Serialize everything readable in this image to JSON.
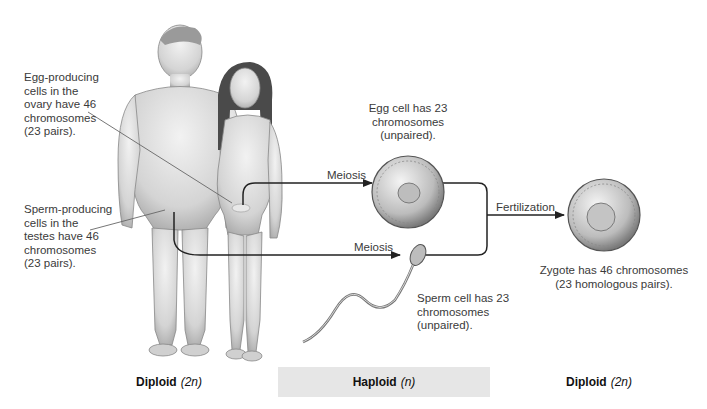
{
  "figure": {
    "callouts": {
      "egg_producing": [
        "Egg-producing",
        "cells in the",
        "ovary have 46",
        "chromosomes",
        "(23 pairs)."
      ],
      "sperm_producing": [
        "Sperm-producing",
        "cells in the",
        "testes have 46",
        "chromosomes",
        "(23 pairs)."
      ],
      "egg_cell": [
        "Egg cell has 23",
        "chromosomes",
        "(unpaired)."
      ],
      "sperm_cell": [
        "Sperm cell has 23",
        "chromosomes",
        "(unpaired)."
      ],
      "zygote": [
        "Zygote has 46 chromosomes",
        "(23 homologous pairs)."
      ]
    },
    "arrows": {
      "meiosis_top": "Meiosis",
      "meiosis_bottom": "Meiosis",
      "fertilization": "Fertilization"
    },
    "bands": [
      {
        "label": "Diploid",
        "notation": "(2n)"
      },
      {
        "label": "Haploid",
        "notation": "(n)"
      },
      {
        "label": "Diploid",
        "notation": "(2n)"
      }
    ],
    "colors": {
      "line": "#222222",
      "pointer": "#666666",
      "haploid_band": "#e6e6e6",
      "cell_fill": "#c8c8c8"
    }
  }
}
